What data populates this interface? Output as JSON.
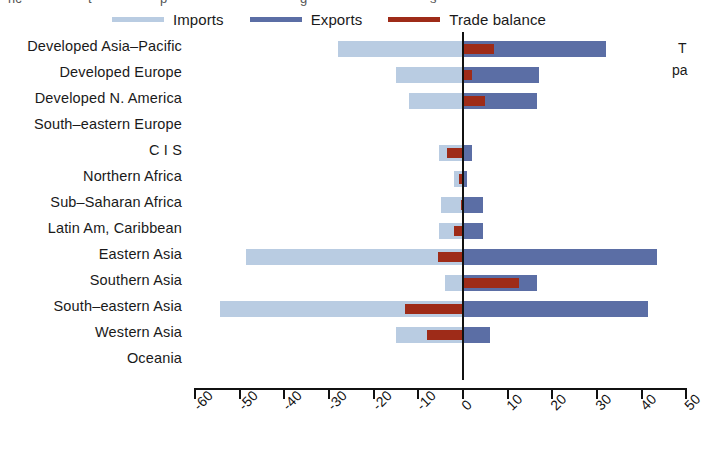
{
  "legend": {
    "items": [
      {
        "label": "Imports",
        "color": "#b9cce2",
        "icon": "line-swatch-imports"
      },
      {
        "label": "Exports",
        "color": "#5b6ea5",
        "icon": "line-swatch-exports"
      },
      {
        "label": "Trade balance",
        "color": "#9e2b18",
        "icon": "line-swatch-trade-balance"
      }
    ]
  },
  "top_clipped_text": [
    {
      "text": "ric",
      "left": 8
    },
    {
      "text": "t",
      "left": 88
    },
    {
      "text": "p",
      "left": 160
    },
    {
      "text": "g",
      "left": 300
    },
    {
      "text": "s",
      "left": 430
    }
  ],
  "side_clipped_text": [
    {
      "text": "T",
      "left": 6,
      "top": 0
    },
    {
      "text": "pa",
      "left": 0,
      "top": 22
    }
  ],
  "axis": {
    "ticks": [
      "-60",
      "-50",
      "-40",
      "-30",
      "-20",
      "-10",
      "0",
      "10",
      "20",
      "30",
      "40",
      "50"
    ],
    "min": -60,
    "max": 50,
    "step": 10
  },
  "colors": {
    "imports": "#b9cce2",
    "exports": "#5b6ea5",
    "balance": "#9e2b18",
    "axis": "#111111",
    "background": "#ffffff"
  },
  "chart_data": {
    "type": "bar",
    "orientation": "horizontal",
    "title": "",
    "subtitle": "",
    "xlabel": "",
    "ylabel": "",
    "xlim": [
      -60,
      50
    ],
    "grid": false,
    "legend_position": "top",
    "categories": [
      "Developed Asia–Pacific",
      "Developed Europe",
      "Developed N. America",
      "South–eastern Europe",
      "C I S",
      "Northern Africa",
      "Sub–Saharan Africa",
      "Latin Am, Caribbean",
      "Eastern Asia",
      "Southern Asia",
      "South–eastern Asia",
      "Western Asia",
      "Oceania"
    ],
    "series": [
      {
        "name": "Imports",
        "color": "#b9cce2",
        "values": [
          -28,
          -15,
          -12,
          0,
          -5.4,
          -2,
          -5,
          -5.4,
          -48.5,
          -4,
          -54.5,
          -15,
          0
        ]
      },
      {
        "name": "Exports",
        "color": "#5b6ea5",
        "values": [
          32,
          17,
          16.5,
          0,
          2,
          1,
          4.5,
          4.5,
          43.5,
          16.5,
          41.5,
          6,
          0
        ]
      },
      {
        "name": "Trade balance",
        "color": "#9e2b18",
        "values": [
          7,
          2,
          5,
          0,
          -3.5,
          -1,
          -0.5,
          -2,
          -5.5,
          12.5,
          -13,
          -8,
          0
        ]
      }
    ]
  }
}
